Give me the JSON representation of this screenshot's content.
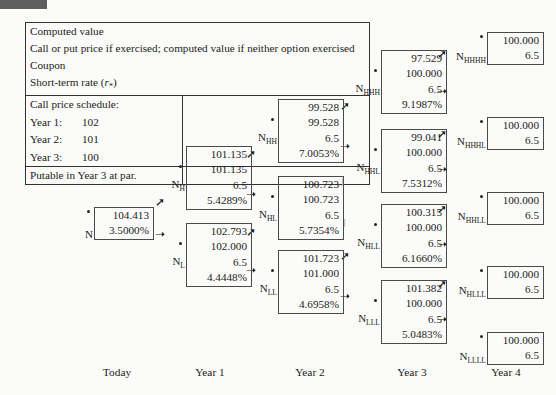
{
  "figure": {
    "corner_marker": "dark-bar"
  },
  "legend": {
    "lines": [
      "Computed value",
      "Call or put price if exercised; computed value if neither option exercised",
      "Coupon",
      "Short-term rate (r*)"
    ],
    "schedule_title": "Call price schedule:",
    "schedule": [
      {
        "year": "Year 1:",
        "price": "102"
      },
      {
        "year": "Year 2:",
        "price": "101"
      },
      {
        "year": "Year 3:",
        "price": "100"
      }
    ],
    "footnote": "Putable in Year 3 at par."
  },
  "axis": {
    "labels": [
      "Today",
      "Year 1",
      "Year 2",
      "Year 3",
      "Year 4"
    ]
  },
  "tree": {
    "root": {
      "label": "N",
      "sub": "",
      "computed_value": "104.413",
      "rate": "3.5000%"
    },
    "year1": [
      {
        "label": "N",
        "sub": "H",
        "computed_value": "101.135",
        "exercise_value": "101.135",
        "coupon": "6.5",
        "rate": "5.4289%"
      },
      {
        "label": "N",
        "sub": "L",
        "computed_value": "102.793",
        "exercise_value": "102.000",
        "coupon": "6.5",
        "rate": "4.4448%"
      }
    ],
    "year2": [
      {
        "label": "N",
        "sub": "HH",
        "computed_value": "99.528",
        "exercise_value": "99.528",
        "coupon": "6.5",
        "rate": "7.0053%"
      },
      {
        "label": "N",
        "sub": "HL",
        "computed_value": "100.723",
        "exercise_value": "100.723",
        "coupon": "6.5",
        "rate": "5.7354%"
      },
      {
        "label": "N",
        "sub": "LL",
        "computed_value": "101.723",
        "exercise_value": "101.000",
        "coupon": "6.5",
        "rate": "4.6958%"
      }
    ],
    "year3": [
      {
        "label": "N",
        "sub": "HHH",
        "computed_value": "97.529",
        "exercise_value": "100.000",
        "coupon": "6.5",
        "rate": "9.1987%"
      },
      {
        "label": "N",
        "sub": "HHL",
        "computed_value": "99.041",
        "exercise_value": "100.000",
        "coupon": "6.5",
        "rate": "7.5312%"
      },
      {
        "label": "N",
        "sub": "HLL",
        "computed_value": "100.315",
        "exercise_value": "100.000",
        "coupon": "6.5",
        "rate": "6.1660%"
      },
      {
        "label": "N",
        "sub": "LLL",
        "computed_value": "101.382",
        "exercise_value": "100.000",
        "coupon": "6.5",
        "rate": "5.0483%"
      }
    ],
    "year4": [
      {
        "label": "N",
        "sub": "HHHH",
        "value": "100.000",
        "coupon": "6.5"
      },
      {
        "label": "N",
        "sub": "HHHL",
        "value": "100.000",
        "coupon": "6.5"
      },
      {
        "label": "N",
        "sub": "HHLL",
        "value": "100.000",
        "coupon": "6.5"
      },
      {
        "label": "N",
        "sub": "HLLL",
        "value": "100.000",
        "coupon": "6.5"
      },
      {
        "label": "N",
        "sub": "LLLL",
        "value": "100.000",
        "coupon": "6.5"
      }
    ]
  },
  "arrows": {
    "up": "↗",
    "down": "↘"
  }
}
